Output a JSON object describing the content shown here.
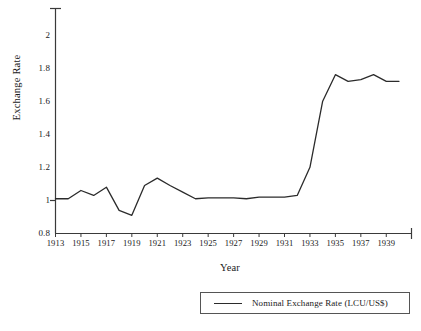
{
  "chart_data": {
    "type": "line",
    "title": "",
    "xlabel": "Year",
    "ylabel": "Exchange Rate",
    "xlim": [
      1913,
      1940
    ],
    "ylim": [
      0.8,
      2.1
    ],
    "grid": false,
    "legend_position": "bottom-right",
    "y_ticks": [
      "0.8",
      "1",
      "1.2",
      "1.4",
      "1.6",
      "1.8",
      "2"
    ],
    "y_tick_values": [
      0.8,
      1.0,
      1.2,
      1.4,
      1.6,
      1.8,
      2.0
    ],
    "x_ticks": [
      "1913",
      "1915",
      "1917",
      "1919",
      "1921",
      "1923",
      "1925",
      "1927",
      "1929",
      "1931",
      "1933",
      "1935",
      "1937",
      "1939"
    ],
    "x_tick_values": [
      1913,
      1915,
      1917,
      1919,
      1921,
      1923,
      1925,
      1927,
      1929,
      1931,
      1933,
      1935,
      1937,
      1939
    ],
    "x": [
      1913,
      1914,
      1915,
      1916,
      1917,
      1918,
      1919,
      1920,
      1921,
      1922,
      1923,
      1924,
      1925,
      1926,
      1927,
      1928,
      1929,
      1930,
      1931,
      1932,
      1933,
      1934,
      1935,
      1936,
      1937,
      1938,
      1939,
      1940
    ],
    "series": [
      {
        "name": "Nominal Exchange Rate (LCU/US$)",
        "color": "#2b2b2b",
        "values": [
          1.01,
          1.01,
          1.06,
          1.03,
          1.08,
          0.94,
          0.91,
          1.09,
          1.135,
          1.09,
          1.05,
          1.01,
          1.015,
          1.015,
          1.015,
          1.01,
          1.02,
          1.02,
          1.02,
          1.03,
          1.2,
          1.6,
          1.76,
          1.72,
          1.73,
          1.76,
          1.72,
          1.72
        ]
      }
    ]
  },
  "legend": {
    "entries": [
      {
        "label": "Nominal Exchange Rate (LCU/US$)"
      }
    ]
  }
}
